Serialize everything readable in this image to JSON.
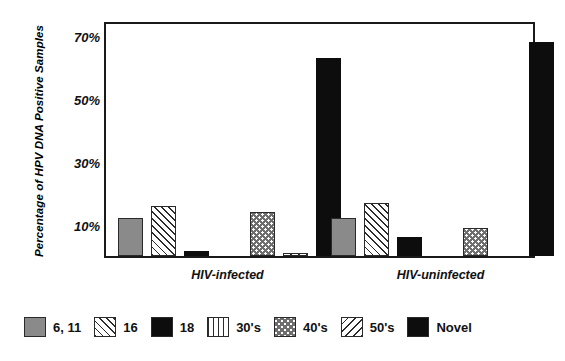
{
  "chart_data": {
    "type": "bar",
    "title": "",
    "subtitle": "",
    "xlabel": "",
    "ylabel": "Percentage of HPV DNA Positive Samples",
    "categories": [
      "HIV-infected",
      "HIV-uninfected"
    ],
    "ylim": [
      0,
      75
    ],
    "yticks": [
      10,
      30,
      50,
      70
    ],
    "ytick_labels": [
      "10%",
      "30%",
      "50%",
      "70%"
    ],
    "grid": false,
    "legend_position": "bottom",
    "series": [
      {
        "name": "6, 11",
        "pattern": "solid-gray",
        "values": [
          12,
          12
        ]
      },
      {
        "name": "16",
        "pattern": "diagonal-hatch",
        "values": [
          16,
          17
        ]
      },
      {
        "name": "18",
        "pattern": "solid-black",
        "values": [
          1.5,
          6
        ]
      },
      {
        "name": "30's",
        "pattern": "vertical-lines",
        "values": [
          0,
          0
        ]
      },
      {
        "name": "40's",
        "pattern": "checkerboard",
        "values": [
          14,
          9
        ]
      },
      {
        "name": "50's",
        "pattern": "diagonal-back-hatch",
        "values": [
          1,
          0
        ]
      },
      {
        "name": "Novel",
        "pattern": "solid-black",
        "values": [
          63,
          68
        ]
      }
    ]
  },
  "legend": {
    "items": [
      {
        "label": "6, 11",
        "pattern": "solid-gray"
      },
      {
        "label": "16",
        "pattern": "diagonal-hatch"
      },
      {
        "label": "18",
        "pattern": "solid-black"
      },
      {
        "label": "30's",
        "pattern": "vertical-lines"
      },
      {
        "label": "40's",
        "pattern": "checkerboard"
      },
      {
        "label": "50's",
        "pattern": "diagonal-back-hatch"
      },
      {
        "label": "Novel",
        "pattern": "solid-black"
      }
    ]
  },
  "colors": {
    "gray_fill": "#8a8a8a",
    "black_fill": "#0d0d0d",
    "hatch_stroke": "#2b2b2b",
    "check_stroke": "#6e6e6e",
    "axis": "#1a1a1a",
    "background": "#ffffff"
  }
}
